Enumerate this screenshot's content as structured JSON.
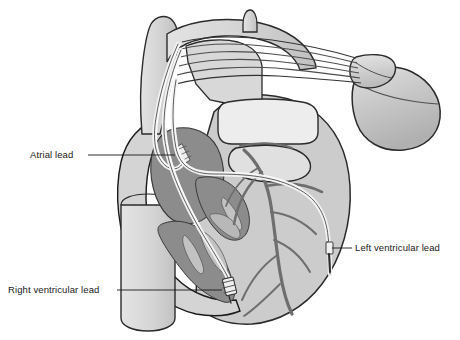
{
  "figure": {
    "background_color": "#ffffff"
  },
  "labels": [
    {
      "id": "atrial-lead",
      "text": "Atrial lead",
      "text_x": 30,
      "text_y": 158,
      "leader_x1": 88,
      "leader_y1": 155,
      "leader_x2": 175,
      "leader_y2": 155
    },
    {
      "id": "right-ventricular-lead",
      "text": "Right ventricular lead",
      "text_x": 8,
      "text_y": 293,
      "leader_x1": 117,
      "leader_y1": 290,
      "leader_x2": 222,
      "leader_y2": 290
    },
    {
      "id": "left-ventricular-lead",
      "text": "Left ventricular lead",
      "text_x": 355,
      "text_y": 251,
      "leader_x1": 330,
      "leader_y1": 248,
      "leader_x2": 352,
      "leader_y2": 248
    }
  ],
  "colors": {
    "outline": "#1a1a1a",
    "myocardium_light": "#cccccc",
    "myocardium_mid": "#bdbdbd",
    "chamber_dark": "#8c8c8c",
    "chamber_darker": "#828282",
    "vessel_light": "#d6d6d6",
    "vessel_pale": "#e2e2e2",
    "white_fill": "#f4f4f4",
    "lead_fill": "#e8e8e8",
    "lead_stroke": "#4d4d4d",
    "device_body": "#c4c4c4",
    "device_header": "#d2d2d2",
    "coronary_vessel": "#6e6e6e",
    "electrode": "#f0f0f0",
    "text": "#1a1a1a"
  },
  "anatomy": [
    {
      "id": "superior-vena-cava",
      "name": "Superior vena cava"
    },
    {
      "id": "aortic-arch",
      "name": "Aortic arch"
    },
    {
      "id": "pulmonary-artery",
      "name": "Pulmonary artery"
    },
    {
      "id": "inferior-vena-cava",
      "name": "Inferior vena cava"
    },
    {
      "id": "right-atrium",
      "name": "Right atrium chamber"
    },
    {
      "id": "right-ventricle",
      "name": "Right ventricle chamber"
    },
    {
      "id": "left-ventricle-wall",
      "name": "Left ventricular free wall"
    },
    {
      "id": "coronary-vessels",
      "name": "Coronary vessels"
    }
  ],
  "device": {
    "id": "pulse-generator",
    "name": "Pacemaker pulse generator",
    "header_name": "Lead connector header"
  },
  "leads": [
    {
      "id": "atrial-lead-wire",
      "name": "Atrial lead wire",
      "tip": "atrial-electrode-tip"
    },
    {
      "id": "rv-lead-wire",
      "name": "Right ventricular lead wire",
      "tip": "rv-electrode-tip"
    },
    {
      "id": "lv-lead-wire",
      "name": "Left ventricular lead wire",
      "tip": "lv-electrode-tip"
    }
  ]
}
